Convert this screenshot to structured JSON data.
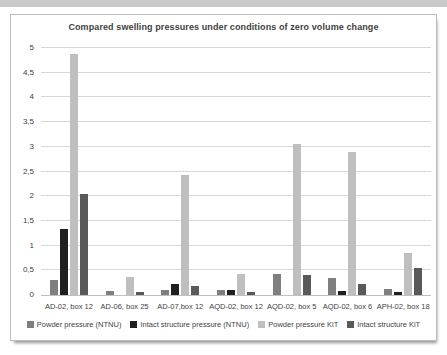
{
  "chart_data": {
    "type": "bar",
    "title": "Compared swelling pressures under conditions of zero volume change",
    "categories": [
      "AD-02, box 12",
      "AD-06, box 25",
      "AD-07,box 12",
      "AQD-02, box 12",
      "AQD-02, box 5",
      "AQD-02, box 6",
      "APH-02, box 18"
    ],
    "series": [
      {
        "name": "Powder pressure (NTNU)",
        "color": "#7f7f7f",
        "values": [
          0.3,
          0.08,
          0.1,
          0.1,
          0.42,
          0.35,
          0.12
        ]
      },
      {
        "name": "Intact structure pressure (NTNU)",
        "color": "#1f1f1f",
        "values": [
          1.33,
          0,
          0.23,
          0.11,
          0,
          0.08,
          0.06
        ]
      },
      {
        "name": "Powder pressure KiT",
        "color": "#bfbfbf",
        "values": [
          4.88,
          0.37,
          2.42,
          0.43,
          3.05,
          2.9,
          0.85
        ]
      },
      {
        "name": "Intact structure KiT",
        "color": "#595959",
        "values": [
          2.05,
          0.07,
          0.19,
          0.06,
          0.4,
          0.22,
          0.55
        ]
      }
    ],
    "ylim": [
      0,
      5
    ],
    "y_ticks": [
      "0",
      "0,5",
      "1",
      "1,5",
      "2",
      "2,5",
      "3",
      "3,5",
      "4",
      "4,5",
      "5"
    ],
    "grid": true,
    "legend_position": "bottom"
  }
}
